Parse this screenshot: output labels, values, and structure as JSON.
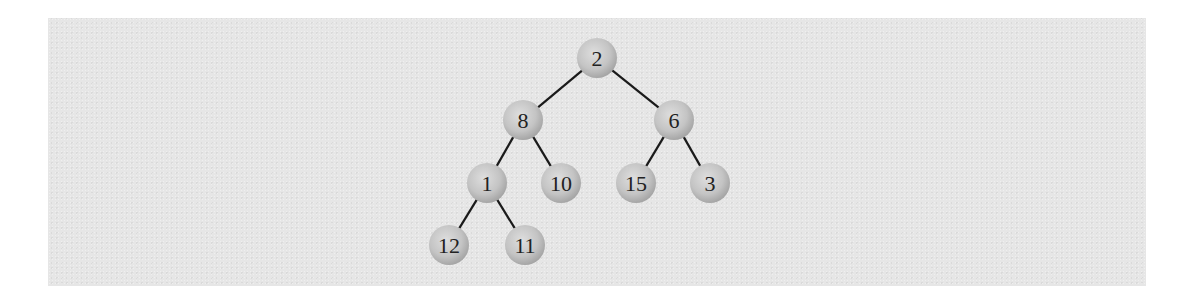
{
  "diagram": {
    "type": "binary-tree",
    "colors": {
      "panel_bg": "#e6e6e6",
      "node_fill_light": "#dcdcdc",
      "node_fill_dark": "#a9a9a9",
      "edge": "#1a1a1a",
      "label": "#222222"
    },
    "nodes": [
      {
        "id": "n2",
        "label": "2",
        "x": 597,
        "y": 58
      },
      {
        "id": "n8",
        "label": "8",
        "x": 523,
        "y": 120
      },
      {
        "id": "n6",
        "label": "6",
        "x": 674,
        "y": 120
      },
      {
        "id": "n1",
        "label": "1",
        "x": 487,
        "y": 183
      },
      {
        "id": "n10",
        "label": "10",
        "x": 561,
        "y": 183
      },
      {
        "id": "n15",
        "label": "15",
        "x": 636,
        "y": 183
      },
      {
        "id": "n3",
        "label": "3",
        "x": 710,
        "y": 183
      },
      {
        "id": "n12",
        "label": "12",
        "x": 449,
        "y": 245
      },
      {
        "id": "n11",
        "label": "11",
        "x": 525,
        "y": 245
      }
    ],
    "edges": [
      {
        "from": "n2",
        "to": "n8"
      },
      {
        "from": "n2",
        "to": "n6"
      },
      {
        "from": "n8",
        "to": "n1"
      },
      {
        "from": "n8",
        "to": "n10"
      },
      {
        "from": "n6",
        "to": "n15"
      },
      {
        "from": "n6",
        "to": "n3"
      },
      {
        "from": "n1",
        "to": "n12"
      },
      {
        "from": "n1",
        "to": "n11"
      }
    ],
    "node_radius": 20
  }
}
